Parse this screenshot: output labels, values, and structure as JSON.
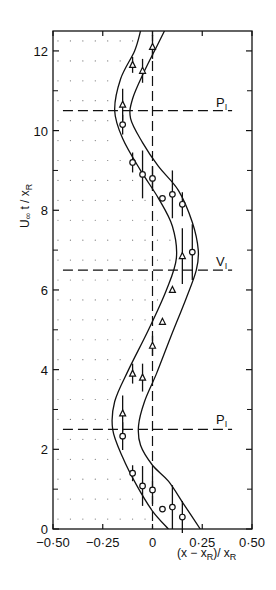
{
  "chart_data": {
    "type": "scatter",
    "title": "",
    "xlabel": "(x − x_R)/x_R",
    "ylabel": "U∞ t / x_R",
    "xlim": [
      -0.5,
      0.5
    ],
    "ylim": [
      0,
      12.5
    ],
    "xticks": [
      "−0·50",
      "−0·25",
      "0",
      "0·25",
      "0·50"
    ],
    "xtick_values": [
      -0.5,
      -0.25,
      0,
      0.25,
      0.5
    ],
    "yticks": [
      "0",
      "2",
      "4",
      "6",
      "8",
      "10",
      "12"
    ],
    "ytick_values": [
      0,
      2,
      4,
      6,
      8,
      10,
      12
    ],
    "grid": false,
    "shaded_region": {
      "x_from": -0.5,
      "x_to_curve": "left_envelope",
      "style": "dotted"
    },
    "series": [
      {
        "name": "circles",
        "marker": "circle",
        "points": [
          {
            "x": 0.15,
            "y": 0.3,
            "err": 0.4
          },
          {
            "x": 0.1,
            "y": 0.55,
            "err": 0.55
          },
          {
            "x": 0.05,
            "y": 0.5,
            "err": 0
          },
          {
            "x": 0.0,
            "y": 0.98,
            "err": 0.35
          },
          {
            "x": -0.05,
            "y": 1.08,
            "err": 0.5
          },
          {
            "x": -0.1,
            "y": 1.4,
            "err": 0.2
          },
          {
            "x": -0.15,
            "y": 2.33,
            "err": 0.35
          },
          {
            "x": 0.2,
            "y": 6.95,
            "err": 0.7
          },
          {
            "x": 0.15,
            "y": 8.15,
            "err": 0.3
          },
          {
            "x": 0.1,
            "y": 8.4,
            "err": 0.6
          },
          {
            "x": 0.05,
            "y": 8.3,
            "err": 0
          },
          {
            "x": 0.0,
            "y": 8.8,
            "err": 0.3
          },
          {
            "x": -0.05,
            "y": 8.9,
            "err": 0.6
          },
          {
            "x": -0.1,
            "y": 9.2,
            "err": 0.25
          },
          {
            "x": -0.15,
            "y": 10.15,
            "err": 0.25
          }
        ]
      },
      {
        "name": "triangles",
        "marker": "triangle",
        "points": [
          {
            "x": -0.15,
            "y": 2.9,
            "err": 0.45
          },
          {
            "x": -0.1,
            "y": 3.9,
            "err": 0.25
          },
          {
            "x": -0.05,
            "y": 3.8,
            "err": 0.35
          },
          {
            "x": 0.0,
            "y": 4.6,
            "err": 0.25
          },
          {
            "x": 0.05,
            "y": 5.2,
            "err": 0
          },
          {
            "x": 0.1,
            "y": 6.0,
            "err": 0
          },
          {
            "x": 0.15,
            "y": 6.85,
            "err": 0.7
          },
          {
            "x": -0.15,
            "y": 10.65,
            "err": 0.4
          },
          {
            "x": -0.05,
            "y": 11.5,
            "err": 0.3
          },
          {
            "x": -0.1,
            "y": 11.65,
            "err": 0.2
          },
          {
            "x": 0.0,
            "y": 12.1,
            "err": 0.3
          }
        ]
      }
    ],
    "curves": [
      {
        "name": "left_envelope",
        "style": "solid",
        "points": [
          [
            0.08,
            0
          ],
          [
            0.0,
            0.45
          ],
          [
            -0.08,
            1.1
          ],
          [
            -0.15,
            1.8
          ],
          [
            -0.2,
            2.5
          ],
          [
            -0.19,
            3.2
          ],
          [
            -0.12,
            4.0
          ],
          [
            -0.02,
            5.0
          ],
          [
            0.07,
            6.0
          ],
          [
            0.12,
            6.8
          ],
          [
            0.1,
            7.6
          ],
          [
            0.03,
            8.3
          ],
          [
            -0.06,
            9.0
          ],
          [
            -0.15,
            9.8
          ],
          [
            -0.19,
            10.5
          ],
          [
            -0.16,
            11.3
          ],
          [
            -0.09,
            12.0
          ],
          [
            -0.06,
            12.5
          ]
        ]
      },
      {
        "name": "right_envelope",
        "style": "solid",
        "points": [
          [
            0.24,
            0
          ],
          [
            0.16,
            0.6
          ],
          [
            0.08,
            1.2
          ],
          [
            0.0,
            1.6
          ],
          [
            -0.06,
            2.1
          ],
          [
            -0.07,
            2.6
          ],
          [
            -0.04,
            3.2
          ],
          [
            0.02,
            3.9
          ],
          [
            0.09,
            4.8
          ],
          [
            0.17,
            5.8
          ],
          [
            0.22,
            6.5
          ],
          [
            0.23,
            7.0
          ],
          [
            0.2,
            7.7
          ],
          [
            0.13,
            8.5
          ],
          [
            0.03,
            9.1
          ],
          [
            -0.05,
            9.7
          ],
          [
            -0.11,
            10.3
          ],
          [
            -0.1,
            10.8
          ],
          [
            -0.04,
            11.5
          ],
          [
            0.02,
            12.1
          ],
          [
            0.06,
            12.5
          ]
        ]
      }
    ],
    "reference_lines": [
      {
        "orientation": "vertical",
        "x": 0,
        "style": "dashed"
      },
      {
        "orientation": "horizontal",
        "y": 2.5,
        "x_from": -0.45,
        "x_to": 0.4,
        "style": "dashed",
        "label": "P_I"
      },
      {
        "orientation": "horizontal",
        "y": 6.5,
        "x_from": -0.45,
        "x_to": 0.4,
        "style": "dashed",
        "label": "V_I"
      },
      {
        "orientation": "horizontal",
        "y": 10.5,
        "x_from": -0.45,
        "x_to": 0.4,
        "style": "dashed",
        "label": "P_I"
      }
    ],
    "annotations": [
      {
        "text": "P_I",
        "x": 0.35,
        "y": 2.7
      },
      {
        "text": "V_I",
        "x": 0.35,
        "y": 6.7
      },
      {
        "text": "P_I",
        "x": 0.35,
        "y": 10.7
      }
    ]
  },
  "labels": {
    "ylabel_main": "U",
    "ylabel_sub_inf": "∞",
    "ylabel_rest": " t / x",
    "ylabel_sub": "R",
    "xlabel_main": "(x − x",
    "xlabel_sub": "R",
    "xlabel_mid": ")/ x",
    "xlabel_sub2": "R",
    "ann_p1": "P",
    "ann_p1_sub": "I",
    "ann_v": "V",
    "ann_v_sub": "I",
    "ann_p2": "P",
    "ann_p2_sub": "I"
  }
}
